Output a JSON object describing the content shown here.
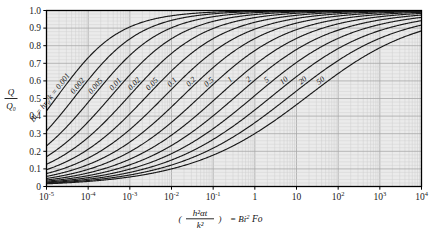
{
  "chart_data": {
    "type": "line",
    "title": "",
    "xlabel": "(h²αt/k²) = Bi² Fo",
    "ylabel": "Q/Q₀",
    "xscale": "log",
    "yscale": "linear",
    "xlim": [
      1e-05,
      10000.0
    ],
    "ylim": [
      0,
      1.0
    ],
    "grid": true,
    "legend_position": "inline-curve-labels",
    "x_tick_labels": [
      "10⁻⁵",
      "10⁻⁴",
      "10⁻³",
      "10⁻²",
      "10⁻¹",
      "1",
      "10",
      "10²",
      "10³",
      "10⁴"
    ],
    "x_tick_mantissa": [
      "10",
      "10",
      "10",
      "10",
      "10",
      "1",
      "10",
      "10",
      "10",
      "10"
    ],
    "x_tick_exponent": [
      "-5",
      "-4",
      "-3",
      "-2",
      "-1",
      "",
      "",
      "2",
      "3",
      "4"
    ],
    "x_tick_values": [
      1e-05,
      0.0001,
      0.001,
      0.01,
      0.1,
      1,
      10,
      100,
      1000,
      10000
    ],
    "y_tick_labels": [
      "0",
      "0.1",
      "0.2",
      "0.3",
      "0.4",
      "0.5",
      "0.6",
      "0.7",
      "0.8",
      "0.9",
      "1.0"
    ],
    "y_tick_values": [
      0,
      0.1,
      0.2,
      0.3,
      0.4,
      0.5,
      0.6,
      0.7,
      0.8,
      0.9,
      1.0
    ],
    "series_parameter_name": "Bi = hr₀/k",
    "first_curve_prefix_label": "Bi = hr₀/k = 0.001",
    "series": [
      {
        "name": "0.001",
        "bi": 0.001,
        "label": "Bi = hr₀/k = 0.001"
      },
      {
        "name": "0.002",
        "bi": 0.002,
        "label": "0.002"
      },
      {
        "name": "0.005",
        "bi": 0.005,
        "label": "0.005"
      },
      {
        "name": "0.01",
        "bi": 0.01,
        "label": "0.01"
      },
      {
        "name": "0.02",
        "bi": 0.02,
        "label": "0.02"
      },
      {
        "name": "0.05",
        "bi": 0.05,
        "label": "0.05"
      },
      {
        "name": "0.1",
        "bi": 0.1,
        "label": "0.1"
      },
      {
        "name": "0.2",
        "bi": 0.2,
        "label": "0.2"
      },
      {
        "name": "0.5",
        "bi": 0.5,
        "label": "0.5"
      },
      {
        "name": "1",
        "bi": 1,
        "label": "1"
      },
      {
        "name": "2",
        "bi": 2,
        "label": "2"
      },
      {
        "name": "5",
        "bi": 5,
        "label": "5"
      },
      {
        "name": "10",
        "bi": 10,
        "label": "10"
      },
      {
        "name": "20",
        "bi": 20,
        "label": "20"
      },
      {
        "name": "50",
        "bi": 50,
        "label": "50"
      }
    ],
    "curve_formula": "Q/Q0 = 1 - exp(X) * erfc(sqrt(X)) mapped per-curve with horizontal shift by Bi",
    "colors": {
      "plot_background": "#ebebeb",
      "page_background": "#ffffff",
      "grid_minor": "#cfcfcf",
      "grid_major": "#a8a8a8",
      "curve": "#1a1a1a",
      "axis": "#000000",
      "text": "#111111"
    }
  },
  "axis": {
    "x_title_numerator": "h²αt",
    "x_title_denominator": "k²",
    "x_title_equals": "= Bi",
    "x_title_exponent": "2",
    "x_title_fo": "Fo",
    "y_title_numerator": "Q",
    "y_title_denominator": "Q₀"
  }
}
